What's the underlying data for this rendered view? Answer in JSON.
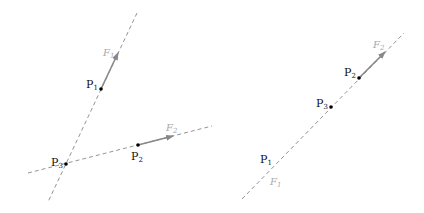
{
  "colors": {
    "line": "#888888",
    "arrow": "#888888",
    "point": "#000000",
    "point_label": "#111111",
    "force_label": "#aaaaaa",
    "background": "#ffffff"
  },
  "left_diagram": {
    "points": [
      {
        "name": "P",
        "sub": "1"
      },
      {
        "name": "P",
        "sub": "2"
      },
      {
        "name": "P",
        "sub": "3"
      }
    ],
    "forces": [
      {
        "name": "F",
        "sub": "1"
      },
      {
        "name": "F",
        "sub": "2"
      }
    ]
  },
  "right_diagram": {
    "points": [
      {
        "name": "P",
        "sub": "1"
      },
      {
        "name": "P",
        "sub": "2"
      },
      {
        "name": "P",
        "sub": "3"
      }
    ],
    "forces": [
      {
        "name": "F",
        "sub": "1"
      },
      {
        "name": "F",
        "sub": "2"
      }
    ]
  }
}
